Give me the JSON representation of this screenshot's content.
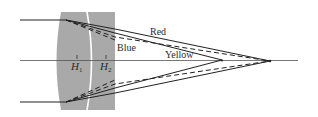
{
  "diagram": {
    "colors": {
      "background": "#ffffff",
      "lens_fill": "#a9a9a9",
      "interface": "#ffffff",
      "ray": "#222222",
      "axis": "#555555"
    },
    "labels": {
      "red": "Red",
      "blue": "Blue",
      "yellow": "Yellow",
      "h1": "H",
      "h1_sub": "1",
      "h2": "H",
      "h2_sub": "2"
    },
    "ray_legend": {
      "solid": "Red / Yellow rays",
      "dashed": "Blue rays"
    }
  }
}
